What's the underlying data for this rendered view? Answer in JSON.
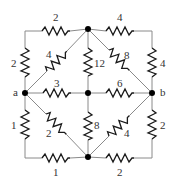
{
  "diagram": {
    "type": "resistor-network",
    "nodes": [
      {
        "id": "a",
        "label": "a",
        "x": 25,
        "y": 93
      },
      {
        "id": "top",
        "label": "",
        "x": 88,
        "y": 29
      },
      {
        "id": "center",
        "label": "",
        "x": 88,
        "y": 93
      },
      {
        "id": "bottom",
        "label": "",
        "x": 88,
        "y": 157
      },
      {
        "id": "b",
        "label": "b",
        "x": 152,
        "y": 93
      }
    ],
    "resistors": [
      {
        "id": "r_top_left",
        "value": "2",
        "from": "a",
        "to": "top",
        "path": "left-edge-upper + top-edge-left"
      },
      {
        "id": "r_left_upper",
        "value": "2"
      },
      {
        "id": "r_top_right",
        "value": "4"
      },
      {
        "id": "r_right_upper",
        "value": "4"
      },
      {
        "id": "r_diag_a_top",
        "value": "4",
        "from": "a",
        "to": "top"
      },
      {
        "id": "r_vert_top_center",
        "value": "12",
        "from": "top",
        "to": "center"
      },
      {
        "id": "r_diag_top_b",
        "value": "8",
        "from": "top",
        "to": "b"
      },
      {
        "id": "r_horiz_a_center",
        "value": "3",
        "from": "a",
        "to": "center"
      },
      {
        "id": "r_horiz_center_b",
        "value": "6",
        "from": "center",
        "to": "b"
      },
      {
        "id": "r_left_lower",
        "value": "1"
      },
      {
        "id": "r_diag_a_bottom",
        "value": "2",
        "from": "a",
        "to": "bottom"
      },
      {
        "id": "r_vert_center_bottom",
        "value": "8",
        "from": "center",
        "to": "bottom"
      },
      {
        "id": "r_diag_bottom_b",
        "value": "4",
        "from": "bottom",
        "to": "b"
      },
      {
        "id": "r_right_lower",
        "value": "2"
      },
      {
        "id": "r_bottom_left",
        "value": "1"
      },
      {
        "id": "r_bottom_right",
        "value": "2"
      }
    ],
    "labels": {
      "node_a": "a",
      "node_b": "b",
      "top_left": "2",
      "left_upper": "2",
      "top_right": "4",
      "right_upper": "4",
      "diag_a_top": "4",
      "vert_top_center": "12",
      "diag_top_b": "8",
      "horiz_a_center": "3",
      "horiz_center_b": "6",
      "left_lower": "1",
      "diag_a_bottom": "2",
      "vert_center_bottom": "8",
      "diag_bottom_b": "4",
      "right_lower": "2",
      "bottom_left": "1",
      "bottom_right": "2"
    }
  }
}
